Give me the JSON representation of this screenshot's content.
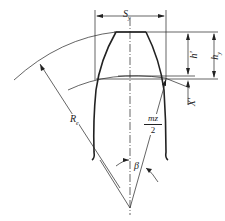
{
  "diagram": {
    "labels": {
      "tooth_thickness": "S",
      "tooth_thickness_sub": "y",
      "addendum_chord": "h'",
      "total_height": "h",
      "total_height_sub": "y",
      "offset": "X'",
      "radius": "R",
      "radius_sub": "e",
      "fraction_num": "mz",
      "fraction_den": "2",
      "angle": "β"
    },
    "colors": {
      "line": "#222222",
      "background": "#ffffff"
    }
  }
}
